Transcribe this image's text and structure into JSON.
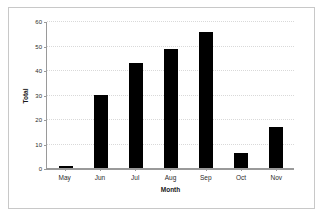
{
  "chart_data": {
    "type": "bar",
    "title": "",
    "xlabel": "Month",
    "ylabel": "Total",
    "categories": [
      "May",
      "Jun",
      "Jul",
      "Aug",
      "Sep",
      "Oct",
      "Nov"
    ],
    "values": [
      1,
      30,
      43,
      49,
      56,
      6,
      17
    ],
    "ylim": [
      0,
      60
    ],
    "ytick_labels": [
      "0",
      "10",
      "20",
      "30",
      "40",
      "50",
      "60"
    ],
    "ytick_values": [
      0,
      10,
      20,
      30,
      40,
      50,
      60
    ],
    "grid": true,
    "legend": false,
    "bar_color": "#000000",
    "grid_color": "#d9d9d9",
    "axis_color": "#9a9a9a",
    "frame_color": "#c8c8c8",
    "background": "#ffffff"
  }
}
